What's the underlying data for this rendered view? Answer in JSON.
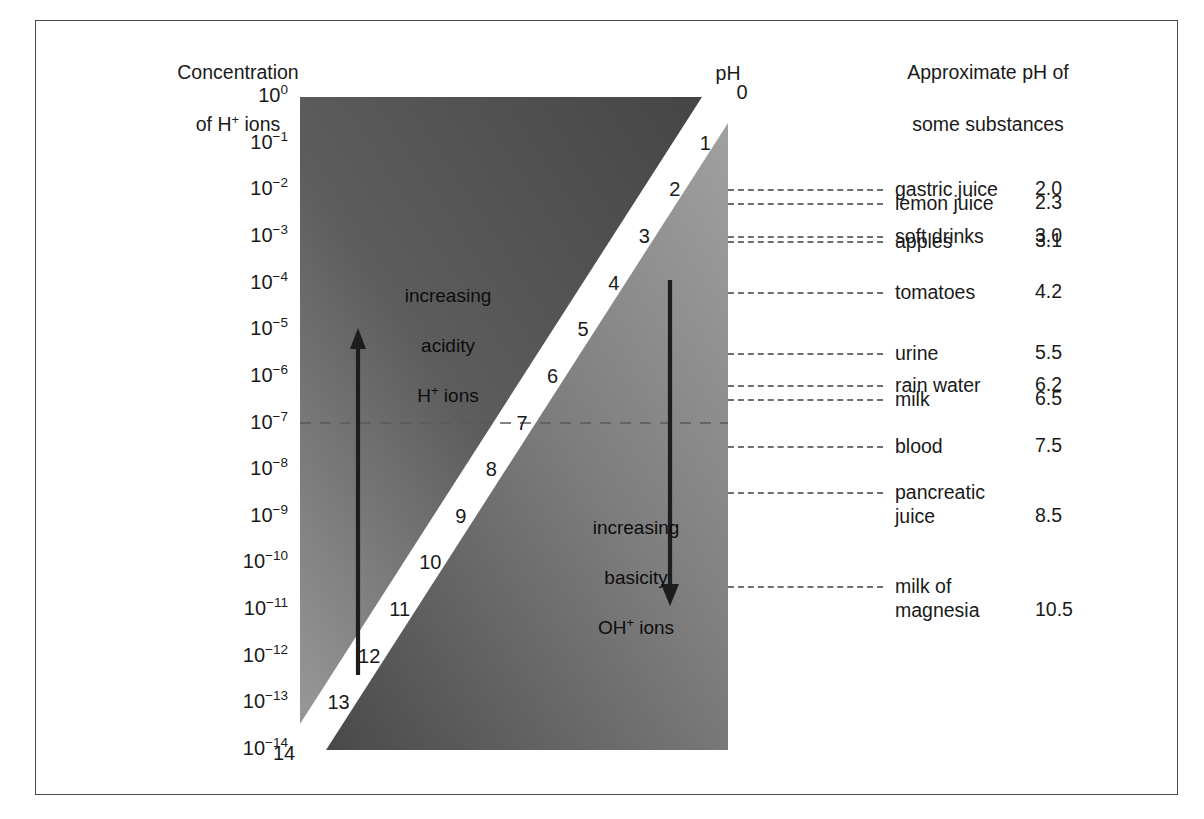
{
  "figure": {
    "left_heading_line1": "Concentration",
    "left_heading_line2_pre": "of H",
    "left_heading_line2_sup": "+",
    "left_heading_line2_post": " ions",
    "right_heading_line1": "Approximate pH of",
    "right_heading_line2": "some substances",
    "ph_axis_caption": "pH"
  },
  "chart_data": {
    "type": "scatter",
    "xlabel": "",
    "ylabel": "Concentration of H+ ions",
    "ylim": [
      0,
      14
    ],
    "grid": false,
    "legend_position": "none",
    "ph_scale": [
      0,
      1,
      2,
      3,
      4,
      5,
      6,
      7,
      8,
      9,
      10,
      11,
      12,
      13,
      14
    ],
    "concentration_ticks": [
      {
        "ph": 0,
        "base": "10",
        "exponent": "0",
        "text": "10⁰"
      },
      {
        "ph": 1,
        "base": "10",
        "exponent": "−1",
        "text": "10⁻¹"
      },
      {
        "ph": 2,
        "base": "10",
        "exponent": "−2",
        "text": "10⁻²"
      },
      {
        "ph": 3,
        "base": "10",
        "exponent": "−3",
        "text": "10⁻³"
      },
      {
        "ph": 4,
        "base": "10",
        "exponent": "−4",
        "text": "10⁻⁴"
      },
      {
        "ph": 5,
        "base": "10",
        "exponent": "−5",
        "text": "10⁻⁵"
      },
      {
        "ph": 6,
        "base": "10",
        "exponent": "−6",
        "text": "10⁻⁶"
      },
      {
        "ph": 7,
        "base": "10",
        "exponent": "−7",
        "text": "10⁻⁷"
      },
      {
        "ph": 8,
        "base": "10",
        "exponent": "−8",
        "text": "10⁻⁸"
      },
      {
        "ph": 9,
        "base": "10",
        "exponent": "−9",
        "text": "10⁻⁹"
      },
      {
        "ph": 10,
        "base": "10",
        "exponent": "−10",
        "text": "10⁻¹⁰"
      },
      {
        "ph": 11,
        "base": "10",
        "exponent": "−11",
        "text": "10⁻¹¹"
      },
      {
        "ph": 12,
        "base": "10",
        "exponent": "−12",
        "text": "10⁻¹²"
      },
      {
        "ph": 13,
        "base": "10",
        "exponent": "−13",
        "text": "10⁻¹³"
      },
      {
        "ph": 14,
        "base": "10",
        "exponent": "−14",
        "text": "10⁻¹⁴"
      }
    ],
    "neutral_ph": 7,
    "substances": [
      {
        "name": "gastric juice",
        "ph": "2.0",
        "ph_value": 2.0
      },
      {
        "name": "lemon juice",
        "ph": "2.3",
        "ph_value": 2.3
      },
      {
        "name": "soft drinks",
        "ph": "3.0",
        "ph_value": 3.0
      },
      {
        "name": "apples",
        "ph": "3.1",
        "ph_value": 3.1
      },
      {
        "name": "tomatoes",
        "ph": "4.2",
        "ph_value": 4.2
      },
      {
        "name": "urine",
        "ph": "5.5",
        "ph_value": 5.5
      },
      {
        "name": "rain water",
        "ph": "6.2",
        "ph_value": 6.2
      },
      {
        "name": "milk",
        "ph": "6.5",
        "ph_value": 6.5
      },
      {
        "name": "blood",
        "ph": "7.5",
        "ph_value": 7.5
      },
      {
        "name": "pancreatic\njuice",
        "ph": "8.5",
        "ph_value": 8.5
      },
      {
        "name": "milk of\nmagnesia",
        "ph": "10.5",
        "ph_value": 10.5
      }
    ],
    "annotations": [
      {
        "id": "acidity",
        "line1": "increasing",
        "line2": "acidity",
        "line3_pre": "H",
        "line3_sup": "+",
        "line3_post": " ions",
        "arrow_direction": "up",
        "arrow_from_ph": 10.3,
        "arrow_to_ph": 2.9
      },
      {
        "id": "basicity",
        "line1": "increasing",
        "line2": "basicity",
        "line3_pre": "OH",
        "line3_sup": "+",
        "line3_post": " ions",
        "arrow_direction": "down",
        "arrow_from_ph": 3.9,
        "arrow_to_ph": 10.9
      }
    ],
    "colors": {
      "acid_dark": "#4a4a4a",
      "acid_light": "#8c8c8c",
      "base_light": "#9a9a9a",
      "base_dark": "#4a4a4a",
      "band": "#ffffff",
      "text": "#1a1a1a",
      "leader_line": "#6f6f6f",
      "frame": "#4a4a4a"
    }
  }
}
